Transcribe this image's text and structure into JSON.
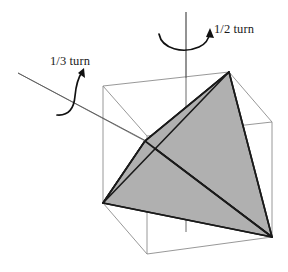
{
  "figure": {
    "colors": {
      "tetrahedron_fill": "#b0b0b0",
      "tetrahedron_edge": "#1a1a1a",
      "cube_edge": "#8c8c8c",
      "axis_line": "#4a4a4a",
      "arrow": "#111111",
      "background": "#ffffff",
      "text": "#1a1a1a"
    },
    "labels": {
      "half_turn": "1/2 turn",
      "third_turn": "1/3 turn"
    },
    "axes": [
      {
        "name": "vertical-axis",
        "label": "1/2 turn",
        "order": 2,
        "description": "vertical face axis through top and bottom cube face centers"
      },
      {
        "name": "diagonal-axis",
        "label": "1/3 turn",
        "order": 3,
        "description": "body diagonal axis through opposite cube vertices"
      }
    ],
    "cube": {
      "name": "cube",
      "vertices": {
        "front_top_left": [
          103,
          86
        ],
        "front_top_right": [
          229,
          72
        ],
        "front_bottom_left": [
          103,
          203
        ],
        "front_bottom_right": [
          229,
          190
        ],
        "back_top_left": [
          147,
          136
        ],
        "back_top_right": [
          272,
          122
        ],
        "back_bottom_left": [
          147,
          254
        ],
        "back_bottom_right": [
          272,
          237
        ]
      }
    },
    "tetrahedron": {
      "name": "tetrahedron",
      "vertices": {
        "apex_top_right": [
          229,
          72
        ],
        "mid_left": [
          145,
          141
        ],
        "bottom_left": [
          103,
          203
        ],
        "bottom_right": [
          272,
          237
        ]
      },
      "shaded_faces": 2
    }
  }
}
